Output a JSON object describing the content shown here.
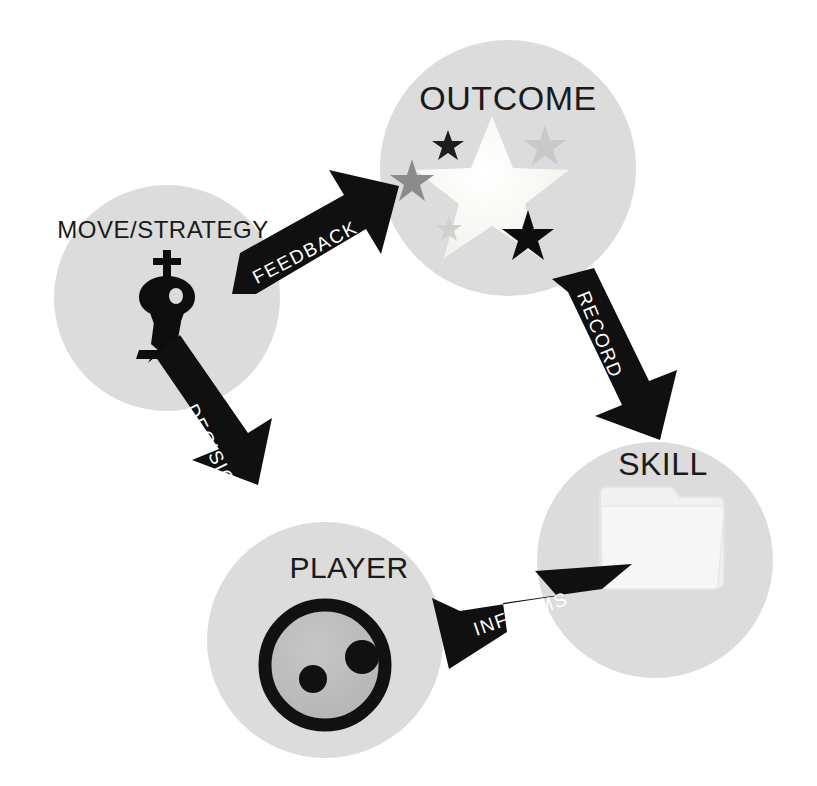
{
  "diagram": {
    "type": "cycle-diagram",
    "background_color": "#ffffff",
    "node_fill_color": "#dcdcdc",
    "arrow_color": "#101010",
    "arrow_label_color": "#ffffff",
    "node_label_color": "#1a1a1a"
  },
  "nodes": [
    {
      "id": "outcome",
      "label": "OUTCOME",
      "icon": "stars-icon",
      "cx": 508,
      "cy": 168,
      "r": 128,
      "label_x": 508,
      "label_y": 110,
      "label_size": 34
    },
    {
      "id": "move-strategy",
      "label": "MOVE/STRATEGY",
      "icon": "chess-king-icon",
      "cx": 167,
      "cy": 298,
      "r": 113,
      "label_x": 163,
      "label_y": 238,
      "label_size": 24
    },
    {
      "id": "skill",
      "label": "SKILL",
      "icon": "folder-icon",
      "cx": 655,
      "cy": 560,
      "r": 118,
      "label_x": 663,
      "label_y": 475,
      "label_size": 32
    },
    {
      "id": "player",
      "label": "PLAYER",
      "icon": "face-icon",
      "cx": 325,
      "cy": 640,
      "r": 118,
      "label_x": 349,
      "label_y": 578,
      "label_size": 30
    }
  ],
  "edges": [
    {
      "id": "feedback",
      "label": "FEEDBACK",
      "from": "move-strategy",
      "to": "outcome",
      "direction": "up-right",
      "label_x": 308,
      "label_y": 258,
      "label_rotation": -27,
      "label_size": 19
    },
    {
      "id": "record",
      "label": "RECORD",
      "from": "outcome",
      "to": "skill",
      "direction": "down-right",
      "label_x": 594,
      "label_y": 337,
      "label_rotation": 68,
      "label_size": 19
    },
    {
      "id": "informs",
      "label": "INFORMS",
      "from": "skill",
      "to": "player",
      "direction": "left-down",
      "label_x": 523,
      "label_y": 620,
      "label_rotation": -19,
      "label_size": 19
    },
    {
      "id": "decision",
      "label": "DECISION",
      "from": "player",
      "to": "move-strategy",
      "direction": "up-left",
      "label_x": 208,
      "label_y": 455,
      "label_rotation": 64,
      "label_size": 19
    }
  ],
  "icons": {
    "stars": {
      "name": "stars-icon",
      "items": [
        {
          "cx": 492,
          "cy": 188,
          "r": 72,
          "color": "#fbfbf6",
          "rotation": 0
        },
        {
          "cx": 448,
          "cy": 145,
          "r": 15,
          "color": "#1d1d1d",
          "rotation": 0
        },
        {
          "cx": 412,
          "cy": 180,
          "r": 21,
          "color": "#8b8b8b",
          "rotation": 0
        },
        {
          "cx": 545,
          "cy": 145,
          "r": 20,
          "color": "#c9c9c9",
          "rotation": 0
        },
        {
          "cx": 449,
          "cy": 228,
          "r": 12,
          "color": "#cccccc",
          "rotation": 0
        },
        {
          "cx": 528,
          "cy": 234,
          "r": 24,
          "color": "#0d0d0d",
          "rotation": 0
        }
      ]
    },
    "chess_king": {
      "name": "chess-king-icon",
      "color": "#0d0d0d"
    },
    "folder": {
      "name": "folder-icon",
      "color": "#f2f2f2"
    },
    "face": {
      "name": "face-icon",
      "ring_color": "#111111",
      "fill_color": "#bdbdbd",
      "eye_color": "#111111",
      "cx": 325,
      "cy": 665,
      "r": 66
    }
  }
}
